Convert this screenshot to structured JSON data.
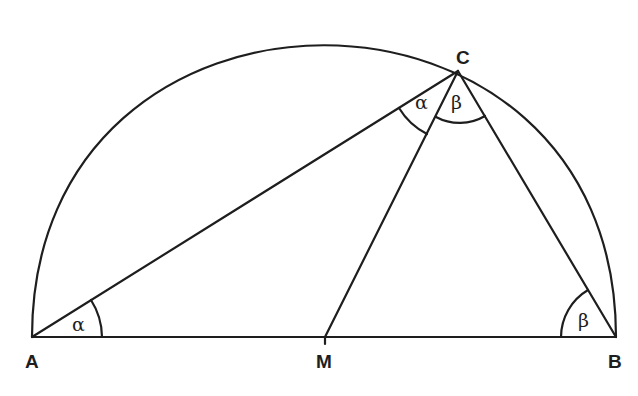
{
  "diagram": {
    "type": "geometry-semicircle",
    "points": {
      "A": {
        "label": "A",
        "x": 32,
        "y": 337
      },
      "M": {
        "label": "M",
        "x": 325,
        "y": 337
      },
      "B": {
        "label": "B",
        "x": 616,
        "y": 337
      },
      "C": {
        "label": "C",
        "x": 458,
        "y": 71
      }
    },
    "segments": [
      "AB",
      "AC",
      "MC",
      "BC"
    ],
    "arc": {
      "center": "M",
      "from": "A",
      "to": "B",
      "kind": "semicircle"
    },
    "angles": [
      {
        "vertex": "A",
        "label": "α",
        "between": [
          "AB",
          "AC"
        ]
      },
      {
        "vertex": "C",
        "label": "α",
        "between": [
          "CA",
          "CM"
        ]
      },
      {
        "vertex": "C",
        "label": "β",
        "between": [
          "CM",
          "CB"
        ]
      },
      {
        "vertex": "B",
        "label": "β",
        "between": [
          "BA",
          "BC"
        ]
      }
    ],
    "labels": {
      "A": "A",
      "M": "M",
      "B": "B",
      "C": "C",
      "alpha": "α",
      "beta": "β"
    }
  }
}
